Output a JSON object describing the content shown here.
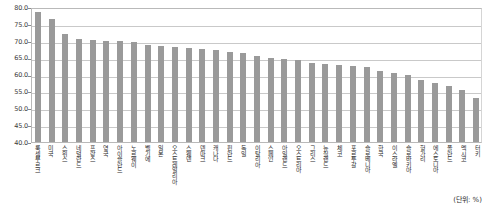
{
  "chart_data": {
    "type": "bar",
    "title": "",
    "subtitle": "",
    "xlabel": "",
    "ylabel": "",
    "ylim": [
      40.0,
      80.0
    ],
    "ytick_step": 5.0,
    "ytick_labels": [
      "80.0",
      "75.0",
      "70.0",
      "65.0",
      "60.0",
      "55.0",
      "50.0",
      "45.0",
      "40.0"
    ],
    "ytick_values": [
      80.0,
      75.0,
      70.0,
      65.0,
      60.0,
      55.0,
      50.0,
      45.0,
      40.0
    ],
    "grid": true,
    "grid_axis": "y",
    "legend": false,
    "legend_position": "none",
    "bar_color": "#9a9a9a",
    "unit_note": "(단위: %)",
    "categories": [
      "룩셈부르크",
      "미국",
      "스위스",
      "네덜란드",
      "프랑스",
      "영국",
      "아이슬란드",
      "노르웨이",
      "벨기에",
      "일본",
      "오스트레일리아",
      "스웨덴",
      "덴마크",
      "캐나다",
      "핀란드",
      "독일",
      "이탈리아",
      "스페인",
      "아일랜드",
      "오스트리아",
      "그리스",
      "뉴질랜드",
      "체코",
      "포르투갈",
      "슬로베니아",
      "한국",
      "이스라엘",
      "슬로바키아",
      "헝가리",
      "에스토니아",
      "폴란드",
      "멕시코",
      "터키"
    ],
    "values": [
      78.5,
      76.5,
      72.0,
      70.5,
      70.3,
      70.0,
      69.8,
      69.5,
      68.8,
      68.5,
      68.2,
      68.0,
      67.5,
      67.2,
      66.8,
      66.5,
      65.5,
      64.8,
      64.5,
      64.2,
      63.5,
      63.0,
      62.8,
      62.5,
      62.2,
      61.0,
      60.5,
      60.0,
      58.5,
      57.5,
      56.5,
      55.5,
      53.0
    ]
  }
}
